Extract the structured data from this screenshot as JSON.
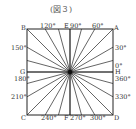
{
  "title": "(図３)",
  "square": {
    "x": 27,
    "y": 29,
    "size": 86
  },
  "center": {
    "x": 70,
    "y": 72
  },
  "ray_step_degrees": 15,
  "line_color": "#222222",
  "corner_labels": {
    "A": "A",
    "B": "B",
    "C": "C",
    "D": "D"
  },
  "midpoint_labels": {
    "E": "E",
    "F": "F",
    "G": "G",
    "H": "H"
  },
  "angle_labels": {
    "top": [
      "120°",
      "90°",
      "60°"
    ],
    "left": [
      "150°",
      "180°",
      "210°"
    ],
    "right": [
      "30°",
      "0°",
      "360°",
      "330°"
    ],
    "bottom": [
      "240°",
      "270°",
      "300°"
    ]
  }
}
